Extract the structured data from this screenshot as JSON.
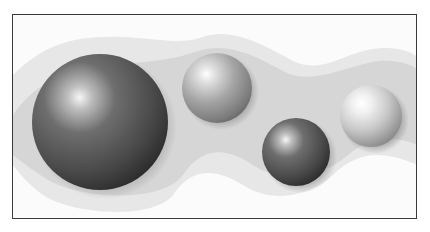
{
  "figure": {
    "colors": {
      "frame_border": "#3a3a3a",
      "background": "#fbfbfb",
      "band_outer": "#e6e6e6",
      "band_inner": "#d4d4d4",
      "sphere_dark": "#2e2e2e",
      "sphere_light": "#f4f4f4"
    },
    "spheres": [
      {
        "name": "large-dark-sphere",
        "cx": 87,
        "cy": 107,
        "r": 68,
        "tone": "dark"
      },
      {
        "name": "medium-light-sphere",
        "cx": 204,
        "cy": 73,
        "r": 35,
        "tone": "mid"
      },
      {
        "name": "small-dark-sphere",
        "cx": 283,
        "cy": 137,
        "r": 34,
        "tone": "dark"
      },
      {
        "name": "small-light-sphere",
        "cx": 358,
        "cy": 101,
        "r": 31,
        "tone": "light"
      }
    ]
  }
}
